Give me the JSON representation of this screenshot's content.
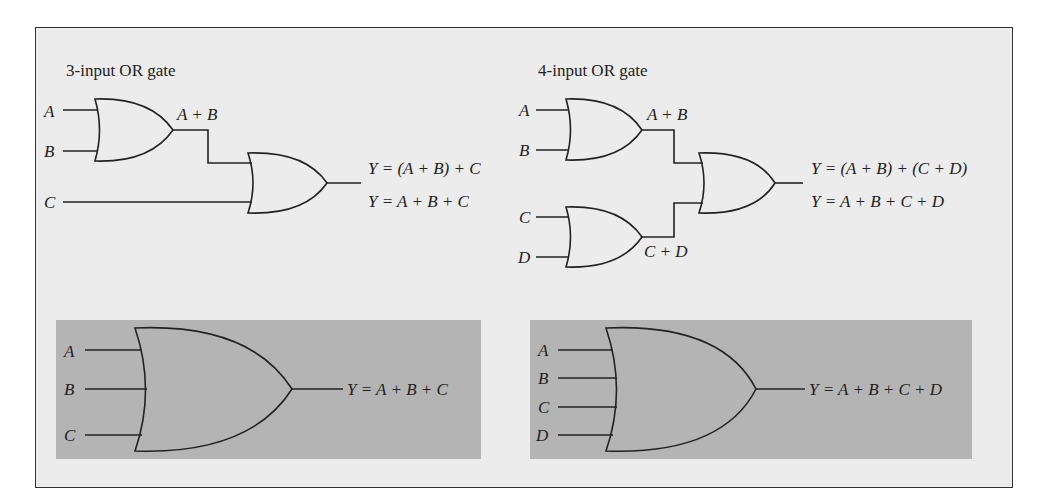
{
  "figure": {
    "panel_3input": {
      "title": "3-input OR gate",
      "inputs": [
        "A",
        "B",
        "C"
      ],
      "intermediate": "A + B",
      "output_expr_1": "Y = (A + B) + C",
      "output_expr_2": "Y = A + B + C"
    },
    "panel_4input": {
      "title": "4-input OR gate",
      "inputs": [
        "A",
        "B",
        "C",
        "D"
      ],
      "intermediate_1": "A + B",
      "intermediate_2": "C + D",
      "output_expr_1": "Y = (A + B) + (C + D)",
      "output_expr_2": "Y = A + B + C + D"
    },
    "symbol_3input": {
      "inputs": [
        "A",
        "B",
        "C"
      ],
      "output_expr": "Y = A + B + C"
    },
    "symbol_4input": {
      "inputs": [
        "A",
        "B",
        "C",
        "D"
      ],
      "output_expr": "Y = A + B + C + D"
    },
    "colors": {
      "background": "#ececec",
      "shaded_box": "#b4b4b4",
      "line": "#222222"
    }
  }
}
